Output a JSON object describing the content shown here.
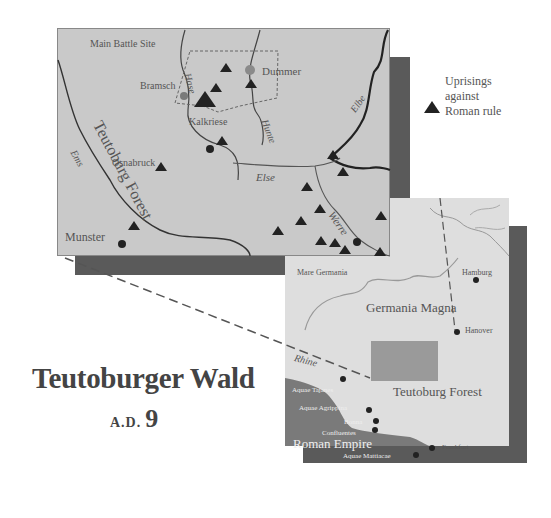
{
  "title": "Teutoburger Wald",
  "subtitle": {
    "era": "A.D.",
    "year": "9"
  },
  "legend": {
    "symbol": "triangle-icon",
    "label_lines": [
      "Uprisings",
      "against",
      "Roman rule"
    ]
  },
  "detail_map": {
    "labels": {
      "main_battle_site": "Main Battle Site",
      "bramsch": "Bramsch",
      "dummer": "Dummer",
      "kalkriese": "Kalkriese",
      "osnabruck": "Osnabruck",
      "munster": "Munster",
      "teutoburg_forest": "Teutoburg Forest",
      "hase": "Hase",
      "hunte": "Hunte",
      "elbe": "Elbe",
      "ems": "Ems",
      "else": "Else",
      "werre": "Werre"
    }
  },
  "overview_map": {
    "labels": {
      "mare_germania": "Mare Germania",
      "hamburg": "Hamburg",
      "germania_magna": "Germania Magna",
      "hanover": "Hanover",
      "rhine": "Rhine",
      "teutoburg_forest": "Teutoburg Forest",
      "aquae_tajanes": "Aquae Tajanes",
      "aquae_agrippina": "Aquae Agrippina",
      "bonna": "Bonna",
      "confluentes": "Confluentes",
      "roman_empire": "Roman Empire",
      "frankfurt": "Frankfurt",
      "aquae_mattiacae": "Aquae Mattiacae"
    }
  },
  "colors": {
    "map_fill": "#c9c9c9",
    "overview_fill": "#dedede",
    "shadow": "#5a5a5a",
    "roman_empire": "#7a7a7a",
    "highlight_box": "#9a9a9a",
    "marker": "#222222",
    "lake": "#8a8a8a"
  }
}
